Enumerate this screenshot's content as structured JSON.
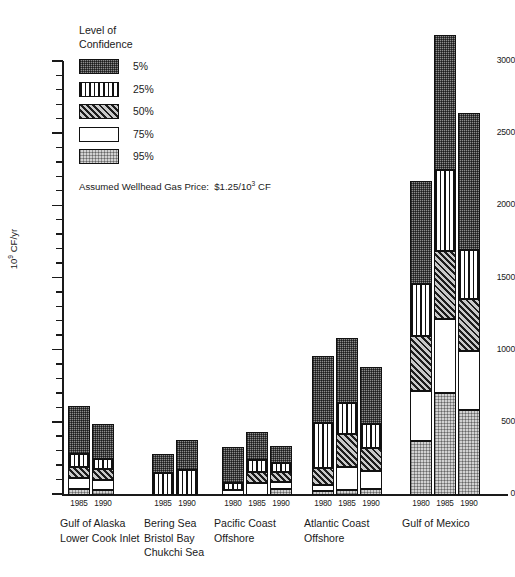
{
  "chart_data": {
    "type": "bar",
    "subtype": "stacked-grouped",
    "title": "",
    "xlabel": "",
    "ylabel": "10⁹ CF/yr",
    "ylim": [
      0,
      3000
    ],
    "ytick_step": 500,
    "yminor_step": 100,
    "ytick_labels": [
      "0",
      "500",
      "1000",
      "1500",
      "2000",
      "2500",
      "3000"
    ],
    "grid": false,
    "legend_title": "Level of\nConfidence",
    "legend_position": "upper-left-inside",
    "annotation": "Assumed Wellhead Gas Price:  $1.25/10³ CF",
    "series": [
      {
        "name": "5%",
        "pattern": "dark-stipple"
      },
      {
        "name": "25%",
        "pattern": "vertical-lines"
      },
      {
        "name": "50%",
        "pattern": "diagonal-hatch"
      },
      {
        "name": "75%",
        "pattern": "white"
      },
      {
        "name": "95%",
        "pattern": "light-stipple"
      }
    ],
    "groups": [
      {
        "category": "Gulf of Alaska\nLower Cook Inlet",
        "bars": [
          {
            "year": "1985",
            "total": 620,
            "segments": [
              {
                "level": "95%",
                "value": 40
              },
              {
                "level": "75%",
                "value": 75
              },
              {
                "level": "50%",
                "value": 80
              },
              {
                "level": "25%",
                "value": 90
              },
              {
                "level": "5%",
                "value": 335
              }
            ]
          },
          {
            "year": "1990",
            "total": 490,
            "segments": [
              {
                "level": "95%",
                "value": 35
              },
              {
                "level": "75%",
                "value": 70
              },
              {
                "level": "50%",
                "value": 75
              },
              {
                "level": "25%",
                "value": 70
              },
              {
                "level": "5%",
                "value": 240
              }
            ]
          }
        ]
      },
      {
        "category": "Bering Sea\nBristol Bay\nChukchi Sea",
        "bars": [
          {
            "year": "1985",
            "total": 285,
            "segments": [
              {
                "level": "95%",
                "value": 0
              },
              {
                "level": "75%",
                "value": 0
              },
              {
                "level": "50%",
                "value": 0
              },
              {
                "level": "25%",
                "value": 150
              },
              {
                "level": "5%",
                "value": 135
              }
            ]
          },
          {
            "year": "1990",
            "total": 380,
            "segments": [
              {
                "level": "95%",
                "value": 0
              },
              {
                "level": "75%",
                "value": 0
              },
              {
                "level": "50%",
                "value": 0
              },
              {
                "level": "25%",
                "value": 170
              },
              {
                "level": "5%",
                "value": 210
              }
            ]
          }
        ]
      },
      {
        "category": "Pacific Coast\nOffshore",
        "bars": [
          {
            "year": "1980",
            "total": 330,
            "segments": [
              {
                "level": "95%",
                "value": 0
              },
              {
                "level": "75%",
                "value": 35
              },
              {
                "level": "50%",
                "value": 0
              },
              {
                "level": "25%",
                "value": 45
              },
              {
                "level": "5%",
                "value": 250
              }
            ]
          },
          {
            "year": "1985",
            "total": 435,
            "segments": [
              {
                "level": "95%",
                "value": 0
              },
              {
                "level": "75%",
                "value": 85
              },
              {
                "level": "50%",
                "value": 75
              },
              {
                "level": "25%",
                "value": 85
              },
              {
                "level": "5%",
                "value": 190
              }
            ]
          },
          {
            "year": "1990",
            "total": 340,
            "segments": [
              {
                "level": "95%",
                "value": 45
              },
              {
                "level": "75%",
                "value": 45
              },
              {
                "level": "50%",
                "value": 70
              },
              {
                "level": "25%",
                "value": 65
              },
              {
                "level": "5%",
                "value": 115
              }
            ]
          }
        ]
      },
      {
        "category": "Atlantic Coast\nOffshore",
        "bars": [
          {
            "year": "1980",
            "total": 960,
            "segments": [
              {
                "level": "95%",
                "value": 30
              },
              {
                "level": "75%",
                "value": 40
              },
              {
                "level": "50%",
                "value": 120
              },
              {
                "level": "25%",
                "value": 310
              },
              {
                "level": "5%",
                "value": 460
              }
            ]
          },
          {
            "year": "1985",
            "total": 1090,
            "segments": [
              {
                "level": "95%",
                "value": 35
              },
              {
                "level": "75%",
                "value": 160
              },
              {
                "level": "50%",
                "value": 230
              },
              {
                "level": "25%",
                "value": 215
              },
              {
                "level": "5%",
                "value": 450
              }
            ]
          },
          {
            "year": "1990",
            "total": 885,
            "segments": [
              {
                "level": "95%",
                "value": 40
              },
              {
                "level": "75%",
                "value": 125
              },
              {
                "level": "50%",
                "value": 160
              },
              {
                "level": "25%",
                "value": 170
              },
              {
                "level": "5%",
                "value": 390
              }
            ]
          }
        ]
      },
      {
        "category": "Gulf of Mexico",
        "bars": [
          {
            "year": "1980",
            "total": 2175,
            "segments": [
              {
                "level": "95%",
                "value": 375
              },
              {
                "level": "75%",
                "value": 345
              },
              {
                "level": "50%",
                "value": 385
              },
              {
                "level": "25%",
                "value": 355
              },
              {
                "level": "5%",
                "value": 715
              }
            ]
          },
          {
            "year": "1985",
            "total": 3190,
            "segments": [
              {
                "level": "95%",
                "value": 710
              },
              {
                "level": "75%",
                "value": 510
              },
              {
                "level": "50%",
                "value": 470
              },
              {
                "level": "25%",
                "value": 565
              },
              {
                "level": "5%",
                "value": 935
              }
            ]
          },
          {
            "year": "1990",
            "total": 2650,
            "segments": [
              {
                "level": "95%",
                "value": 590
              },
              {
                "level": "75%",
                "value": 410
              },
              {
                "level": "50%",
                "value": 355
              },
              {
                "level": "25%",
                "value": 345
              },
              {
                "level": "5%",
                "value": 950
              }
            ]
          }
        ]
      }
    ]
  }
}
